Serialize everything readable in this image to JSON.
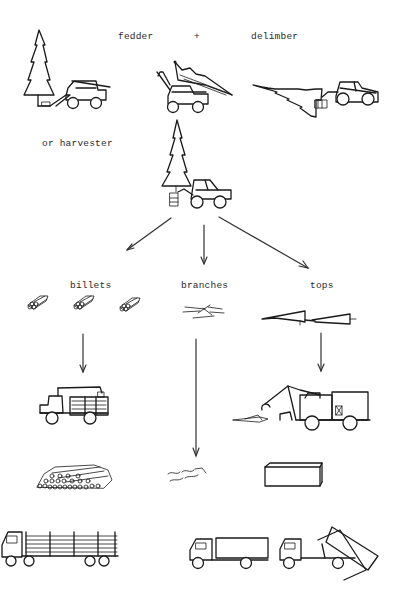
{
  "diagram": {
    "stage1": {
      "label_feller": "fedder",
      "label_plus": "+",
      "label_delimber": "delimber",
      "items": [
        "tree-with-feller",
        "feller-carrying-tree",
        "delimber-processing-tree"
      ]
    },
    "stage2": {
      "label_harvester": "or harvester",
      "items": [
        "harvester-with-tree"
      ]
    },
    "products": {
      "billets": {
        "label": "billets"
      },
      "branches": {
        "label": "branches"
      },
      "tops": {
        "label": "tops"
      }
    },
    "transport": {
      "billets_chain": [
        "forwarder-loaded",
        "log-pile",
        "log-truck-trailer"
      ],
      "branches_chain": [
        "scattered-branches"
      ],
      "tops_chain": [
        "tops-forwarder-with-bin",
        "container-box",
        "container-truck",
        "dump-truck-tipping"
      ]
    },
    "colors": {
      "line": "#1a1a1a",
      "background": "#ffffff",
      "text": "#2a2a2a"
    }
  }
}
